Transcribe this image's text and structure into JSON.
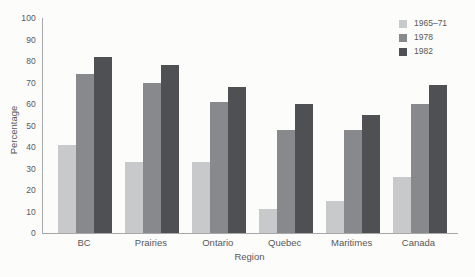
{
  "chart_data": {
    "type": "bar",
    "title": "",
    "xlabel": "Region",
    "ylabel": "Percentage",
    "categories": [
      "BC",
      "Prairies",
      "Ontario",
      "Quebec",
      "Maritimes",
      "Canada"
    ],
    "series": [
      {
        "name": "1965–71",
        "color": "#c7c9cb",
        "values": [
          41,
          33,
          33,
          11,
          15,
          26
        ]
      },
      {
        "name": "1978",
        "color": "#88898c",
        "values": [
          74,
          70,
          61,
          48,
          48,
          60
        ]
      },
      {
        "name": "1982",
        "color": "#4e5053",
        "values": [
          82,
          78,
          68,
          60,
          55,
          69
        ]
      }
    ],
    "ylim": [
      0,
      100
    ],
    "ytick_step": 10,
    "grid": false,
    "legend_position": "top-right"
  },
  "palette": {
    "axis_line": "#a6a8aa",
    "text": "#57585a",
    "background": "#fcfcfa"
  }
}
